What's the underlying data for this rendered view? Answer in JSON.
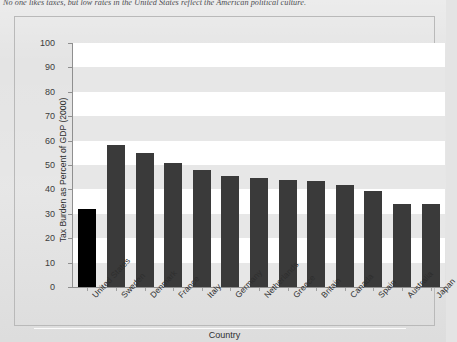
{
  "caption": "No one likes taxes, but low rates in the United States reflect the American political culture.",
  "chart_data": {
    "type": "bar",
    "title": "",
    "xlabel": "Country",
    "ylabel": "Tax Burden as Percent of GDP (2000)",
    "ylim": [
      0,
      100
    ],
    "ytick_labels": [
      "100",
      "90",
      "80",
      "70",
      "60",
      "50",
      "40",
      "30",
      "20",
      "10",
      "0"
    ],
    "ytick_values": [
      100,
      90,
      80,
      70,
      60,
      50,
      40,
      30,
      20,
      10,
      0
    ],
    "grid": false,
    "banded_background": true,
    "band_unit": 10,
    "legend": null,
    "categories": [
      "United States",
      "Sweden",
      "Denmark",
      "France",
      "Italy",
      "Germany",
      "Netherlands",
      "Greece",
      "Britain",
      "Canada",
      "Spain",
      "Australia",
      "Japan"
    ],
    "values": [
      32,
      58,
      55,
      51,
      48,
      45.5,
      44.5,
      44,
      43.5,
      42,
      39.5,
      34,
      34
    ],
    "bar_colors": [
      "#000000",
      "#3a3a3a",
      "#3a3a3a",
      "#3a3a3a",
      "#3a3a3a",
      "#3a3a3a",
      "#3a3a3a",
      "#3a3a3a",
      "#3a3a3a",
      "#3a3a3a",
      "#3a3a3a",
      "#3a3a3a",
      "#3a3a3a"
    ],
    "highlight_category": "United States",
    "colors": {
      "highlight_bar": "#000000",
      "default_bar": "#3a3a3a",
      "band_light": "#ffffff",
      "band_dark": "#e7e7e7",
      "axis": "#8f8f8f",
      "page": "#e4e4e4"
    }
  }
}
